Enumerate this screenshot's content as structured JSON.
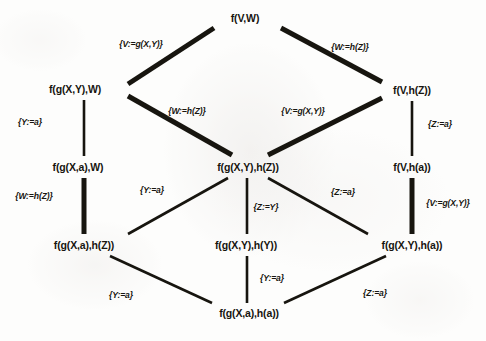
{
  "diagram": {
    "kind": "substitution-lattice",
    "ink_color": "#17150f",
    "background_color": "#fdfdfc",
    "nodes": [
      {
        "id": "top",
        "label": "f(V,W)",
        "x": 245,
        "y": 18
      },
      {
        "id": "left1",
        "label": "f(g(X,Y),W)",
        "x": 75,
        "y": 89
      },
      {
        "id": "right1",
        "label": "f(V,h(Z))",
        "x": 412,
        "y": 90
      },
      {
        "id": "left2",
        "label": "f(g(X,a),W)",
        "x": 78,
        "y": 167
      },
      {
        "id": "center",
        "label": "f(g(X,Y),h(Z))",
        "x": 248,
        "y": 167
      },
      {
        "id": "right2",
        "label": "f(V,h(a))",
        "x": 412,
        "y": 167
      },
      {
        "id": "left3",
        "label": "f(g(X,a),h(Z))",
        "x": 84,
        "y": 245
      },
      {
        "id": "center3",
        "label": "f(g(X,Y),h(Y))",
        "x": 246,
        "y": 245
      },
      {
        "id": "right3",
        "label": "f(g(X,Y),h(a))",
        "x": 412,
        "y": 245
      },
      {
        "id": "bottom",
        "label": "f(g(X,a),h(a))",
        "x": 249,
        "y": 313
      }
    ],
    "edges": [
      {
        "id": "e1",
        "from": "left1",
        "to": "top",
        "x1": 128,
        "y1": 84,
        "x2": 214,
        "y2": 28,
        "width": 5.0
      },
      {
        "id": "e2",
        "from": "top",
        "to": "right1",
        "x1": 281,
        "y1": 28,
        "x2": 382,
        "y2": 82,
        "width": 5.0
      },
      {
        "id": "e3",
        "from": "left1",
        "to": "center",
        "x1": 128,
        "y1": 96,
        "x2": 232,
        "y2": 155,
        "width": 5.0
      },
      {
        "id": "e4",
        "from": "center",
        "to": "right1",
        "x1": 268,
        "y1": 155,
        "x2": 382,
        "y2": 98,
        "width": 5.0
      },
      {
        "id": "e5",
        "from": "left1",
        "to": "left2",
        "x1": 84,
        "y1": 100,
        "x2": 84,
        "y2": 156,
        "width": 2.6
      },
      {
        "id": "e6",
        "from": "right1",
        "to": "right2",
        "x1": 412,
        "y1": 101,
        "x2": 412,
        "y2": 156,
        "width": 2.6
      },
      {
        "id": "e7",
        "from": "left2",
        "to": "left3",
        "x1": 84,
        "y1": 178,
        "x2": 84,
        "y2": 234,
        "width": 5.0
      },
      {
        "id": "e8",
        "from": "center",
        "to": "left3",
        "x1": 228,
        "y1": 178,
        "x2": 128,
        "y2": 234,
        "width": 2.6
      },
      {
        "id": "e9",
        "from": "center",
        "to": "center3",
        "x1": 247,
        "y1": 178,
        "x2": 247,
        "y2": 234,
        "width": 2.6
      },
      {
        "id": "e10",
        "from": "center",
        "to": "right3",
        "x1": 268,
        "y1": 178,
        "x2": 368,
        "y2": 234,
        "width": 2.6
      },
      {
        "id": "e11",
        "from": "right2",
        "to": "right3",
        "x1": 412,
        "y1": 178,
        "x2": 412,
        "y2": 234,
        "width": 5.0
      },
      {
        "id": "e12",
        "from": "left3",
        "to": "bottom",
        "x1": 110,
        "y1": 256,
        "x2": 212,
        "y2": 303,
        "width": 2.6
      },
      {
        "id": "e13",
        "from": "center3",
        "to": "bottom",
        "x1": 247,
        "y1": 256,
        "x2": 247,
        "y2": 303,
        "width": 2.6
      },
      {
        "id": "e14",
        "from": "right3",
        "to": "bottom",
        "x1": 386,
        "y1": 256,
        "x2": 284,
        "y2": 303,
        "width": 2.6
      }
    ],
    "substitution_labels": [
      {
        "id": "s1",
        "edge": "e1",
        "text": "{V:=g(X,Y)}",
        "x": 141,
        "y": 44
      },
      {
        "id": "s2",
        "edge": "e2",
        "text": "{W:=h(Z)}",
        "x": 350,
        "y": 47
      },
      {
        "id": "s3",
        "edge": "e3",
        "text": "{W:=h(Z)}",
        "x": 187,
        "y": 111
      },
      {
        "id": "s4",
        "edge": "e4",
        "text": "{V:=g(X,Y)}",
        "x": 303,
        "y": 111
      },
      {
        "id": "s5",
        "edge": "e5",
        "text": "{Y:=a}",
        "x": 30,
        "y": 122
      },
      {
        "id": "s6",
        "edge": "e6",
        "text": "{Z:=a}",
        "x": 440,
        "y": 124
      },
      {
        "id": "s7",
        "edge": "e7",
        "text": "{W:=h(Z)}",
        "x": 34,
        "y": 196
      },
      {
        "id": "s8",
        "edge": "e8",
        "text": "{Y:=a}",
        "x": 152,
        "y": 190
      },
      {
        "id": "s9",
        "edge": "e9",
        "text": "{Z:=Y}",
        "x": 266,
        "y": 207
      },
      {
        "id": "s10",
        "edge": "e10",
        "text": "{Z:=a}",
        "x": 343,
        "y": 192
      },
      {
        "id": "s11",
        "edge": "e11",
        "text": "{V:=g(X,Y)}",
        "x": 448,
        "y": 203
      },
      {
        "id": "s12",
        "edge": "e12",
        "text": "{Y:=a}",
        "x": 121,
        "y": 295
      },
      {
        "id": "s13",
        "edge": "e13",
        "text": "{Y:=a}",
        "x": 272,
        "y": 278
      },
      {
        "id": "s14",
        "edge": "e14",
        "text": "{Z:=a}",
        "x": 375,
        "y": 293
      }
    ]
  }
}
